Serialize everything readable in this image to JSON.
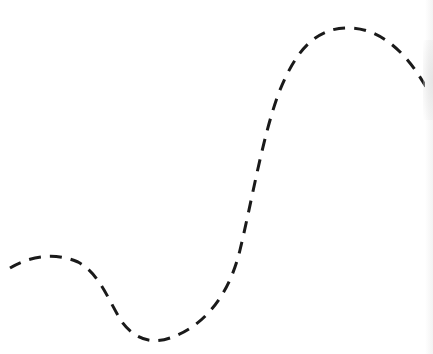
{
  "diagram": {
    "background": "#ffffff",
    "stroke_color": "#1a1a1a",
    "stroke_width": 3,
    "dash_pattern": "12 9",
    "curve": {
      "description": "dashed S-shaped curve",
      "path": "M 10 268 C 30 256, 55 252, 78 262 C 100 274, 108 300, 122 322 C 134 338, 150 345, 170 338 C 200 328, 228 300, 240 250 C 252 200, 262 140, 278 95 C 296 48, 318 26, 352 28 C 385 30, 412 58, 433 100"
    }
  }
}
